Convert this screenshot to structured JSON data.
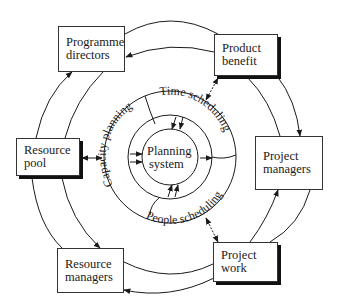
{
  "diagram": {
    "nodes": [
      {
        "id": "programme-directors",
        "lines": [
          "Programme",
          "directors"
        ],
        "shadow": false
      },
      {
        "id": "product-benefit",
        "lines": [
          "Product",
          "benefit"
        ],
        "shadow": true
      },
      {
        "id": "project-managers",
        "lines": [
          "Project",
          "managers"
        ],
        "shadow": false
      },
      {
        "id": "project-work",
        "lines": [
          "Project",
          "work"
        ],
        "shadow": true
      },
      {
        "id": "resource-managers",
        "lines": [
          "Resource",
          "managers"
        ],
        "shadow": false
      },
      {
        "id": "resource-pool",
        "lines": [
          "Resource",
          "pool"
        ],
        "shadow": true
      }
    ],
    "center": {
      "lines": [
        "Planning",
        "system"
      ]
    },
    "ring_segments": {
      "time": "Time scheduling",
      "people": "People scheduling",
      "capacity": "Capacity planning"
    },
    "flow_direction": "clockwise outer loop, counter-clockwise inner loop",
    "colors": {
      "line": "#1a1a1a",
      "background": "#ffffff",
      "shadow": "#111111"
    }
  }
}
